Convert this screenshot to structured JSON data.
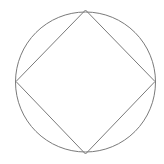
{
  "diagram": {
    "stroke_color": "#7a7a7a",
    "background": "#ffffff",
    "circle": {
      "cx": 85.5,
      "cy": 82,
      "r": 70
    },
    "square": {
      "vertices": [
        {
          "x": 85.5,
          "y": 10
        },
        {
          "x": 155,
          "y": 81.5
        },
        {
          "x": 85.5,
          "y": 154
        },
        {
          "x": 16,
          "y": 81.5
        }
      ]
    }
  }
}
